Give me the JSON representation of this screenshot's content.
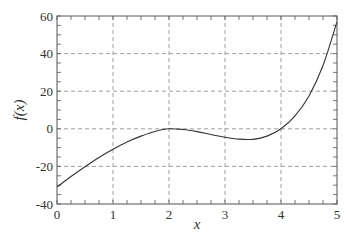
{
  "chart_data": {
    "type": "line",
    "title": "",
    "xlabel": "x",
    "ylabel": "f(x)",
    "xlim": [
      0,
      5
    ],
    "ylim": [
      -40,
      60
    ],
    "xticks": [
      0,
      1,
      2,
      3,
      4,
      5
    ],
    "yticks": [
      -40,
      -20,
      0,
      20,
      40,
      60
    ],
    "xtick_labels": [
      "0",
      "1",
      "2",
      "3",
      "4",
      "5"
    ],
    "ytick_labels": [
      "-40",
      "-20",
      "0",
      "20",
      "40",
      "60"
    ],
    "grid": true,
    "grid_style": "dashed",
    "legend": null,
    "series": [
      {
        "name": "f(x)",
        "color": "#333333",
        "x": [
          0,
          0.25,
          0.5,
          0.75,
          1,
          1.25,
          1.5,
          1.75,
          2,
          2.25,
          2.5,
          2.75,
          3,
          3.25,
          3.5,
          3.75,
          4,
          4.25,
          4.5,
          4.75,
          5
        ],
        "y": [
          -31,
          -25.4,
          -20.2,
          -15.3,
          -10.9,
          -7.0,
          -3.9,
          -1.4,
          0,
          -0.4,
          -1.5,
          -3.0,
          -4.5,
          -5.5,
          -5.6,
          -3.9,
          0,
          6.9,
          17.5,
          33.7,
          57
        ]
      }
    ]
  }
}
